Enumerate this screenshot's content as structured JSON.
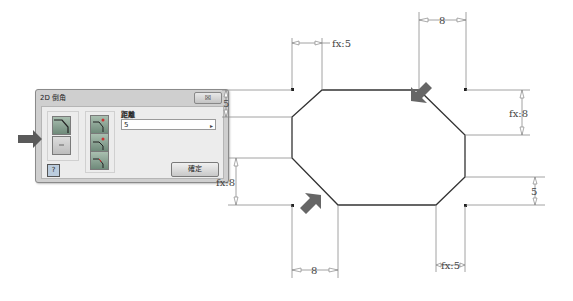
{
  "dialog": {
    "title": "2D 倒角",
    "close_label": "☒",
    "distance_label": "距離",
    "distance_value": "5",
    "dropdown_glyph": "▸",
    "help_label": "?",
    "ok_label": "確定",
    "mode_buttons": [
      "equal-distance",
      "two-distance",
      "distance-angle"
    ],
    "option_icons": [
      "chamfer-mode-a",
      "chamfer-mode-b"
    ]
  },
  "drawing": {
    "dimensions": {
      "top_left": "fx:5",
      "top_right": "8",
      "right_upper": "fx:8",
      "right_lower": "5",
      "left_upper": "5",
      "left_lower": "fx:8",
      "bottom_left": "8",
      "bottom_right": "fx:5"
    },
    "colors": {
      "outline": "#333333",
      "dimension": "#888888",
      "arrow": "#666666"
    }
  }
}
